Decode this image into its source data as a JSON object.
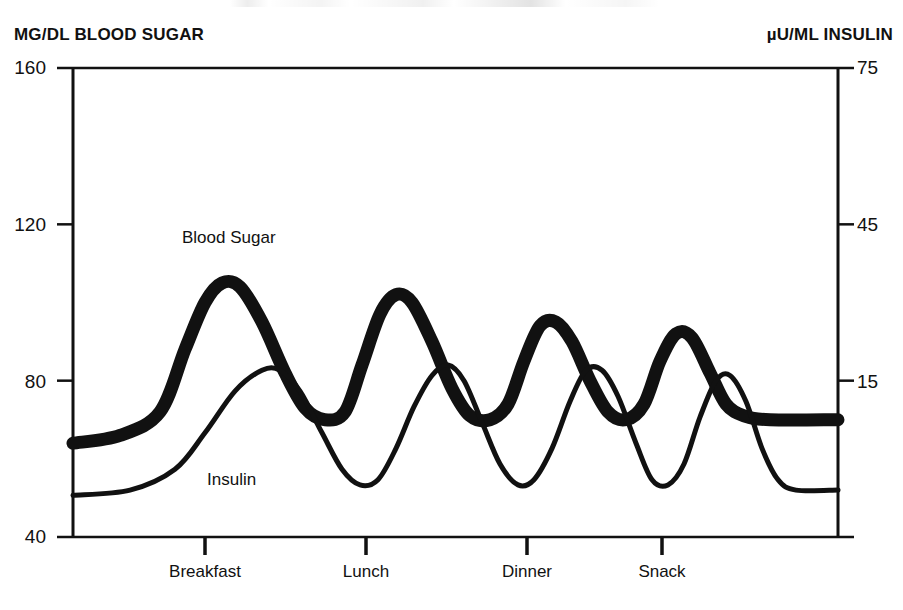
{
  "figure": {
    "width": 903,
    "height": 610,
    "background": "#ffffff",
    "ink_color": "#111111"
  },
  "left_axis": {
    "title": "MG/DL BLOOD SUGAR",
    "ticks": [
      "160",
      "120",
      "80",
      "40"
    ],
    "min": 40,
    "max": 160
  },
  "right_axis": {
    "title": "µU/ML INSULIN",
    "ticks": [
      "75",
      "45",
      "15"
    ],
    "min": -15,
    "max": 75
  },
  "x_axis": {
    "ticks": [
      "Breakfast",
      "Lunch",
      "Dinner",
      "Snack"
    ]
  },
  "series_labels": {
    "blood_sugar": "Blood Sugar",
    "insulin": "Insulin"
  },
  "chart_data": {
    "type": "line",
    "title": "",
    "xlabel": "",
    "ylabel": "MG/DL BLOOD SUGAR",
    "y2label": "µU/ML INSULIN",
    "ylim": [
      40,
      160
    ],
    "y2lim": [
      -15,
      75
    ],
    "grid": false,
    "legend": "inline-annotations",
    "xticks": [
      "Breakfast",
      "Lunch",
      "Dinner",
      "Snack"
    ],
    "xtick_positions": [
      205,
      366,
      527,
      662
    ],
    "yticks": [
      160,
      120,
      80,
      40
    ],
    "y2ticks": [
      75,
      45,
      15
    ],
    "series": [
      {
        "name": "Blood Sugar",
        "axis": "left",
        "units": "mg/dL",
        "style": "thick",
        "linewidth_px": 13,
        "color": "#111111",
        "points": [
          {
            "x": 73,
            "value": 64
          },
          {
            "x": 120,
            "value": 66
          },
          {
            "x": 160,
            "value": 72
          },
          {
            "x": 185,
            "value": 88
          },
          {
            "x": 205,
            "value": 100
          },
          {
            "x": 222,
            "value": 105
          },
          {
            "x": 240,
            "value": 104
          },
          {
            "x": 262,
            "value": 95
          },
          {
            "x": 285,
            "value": 82
          },
          {
            "x": 305,
            "value": 73
          },
          {
            "x": 325,
            "value": 70
          },
          {
            "x": 345,
            "value": 72
          },
          {
            "x": 362,
            "value": 84
          },
          {
            "x": 380,
            "value": 97
          },
          {
            "x": 396,
            "value": 102
          },
          {
            "x": 412,
            "value": 100
          },
          {
            "x": 432,
            "value": 90
          },
          {
            "x": 452,
            "value": 78
          },
          {
            "x": 470,
            "value": 71
          },
          {
            "x": 490,
            "value": 70
          },
          {
            "x": 508,
            "value": 74
          },
          {
            "x": 524,
            "value": 85
          },
          {
            "x": 540,
            "value": 94
          },
          {
            "x": 556,
            "value": 95
          },
          {
            "x": 572,
            "value": 90
          },
          {
            "x": 590,
            "value": 80
          },
          {
            "x": 608,
            "value": 72
          },
          {
            "x": 626,
            "value": 70
          },
          {
            "x": 644,
            "value": 74
          },
          {
            "x": 660,
            "value": 85
          },
          {
            "x": 676,
            "value": 92
          },
          {
            "x": 692,
            "value": 91
          },
          {
            "x": 710,
            "value": 82
          },
          {
            "x": 726,
            "value": 74
          },
          {
            "x": 744,
            "value": 71
          },
          {
            "x": 770,
            "value": 70
          },
          {
            "x": 838,
            "value": 70
          }
        ]
      },
      {
        "name": "Insulin",
        "axis": "right",
        "units": "µU/mL",
        "style": "thin",
        "linewidth_px": 5,
        "color": "#111111",
        "points": [
          {
            "x": 73,
            "value": -7
          },
          {
            "x": 130,
            "value": -6
          },
          {
            "x": 175,
            "value": -2
          },
          {
            "x": 205,
            "value": 5
          },
          {
            "x": 235,
            "value": 13
          },
          {
            "x": 262,
            "value": 17
          },
          {
            "x": 280,
            "value": 17
          },
          {
            "x": 300,
            "value": 13
          },
          {
            "x": 322,
            "value": 5
          },
          {
            "x": 342,
            "value": -2
          },
          {
            "x": 360,
            "value": -5
          },
          {
            "x": 378,
            "value": -4
          },
          {
            "x": 396,
            "value": 2
          },
          {
            "x": 414,
            "value": 10
          },
          {
            "x": 432,
            "value": 16
          },
          {
            "x": 448,
            "value": 18
          },
          {
            "x": 464,
            "value": 15
          },
          {
            "x": 482,
            "value": 7
          },
          {
            "x": 500,
            "value": -1
          },
          {
            "x": 518,
            "value": -5
          },
          {
            "x": 534,
            "value": -4
          },
          {
            "x": 552,
            "value": 2
          },
          {
            "x": 570,
            "value": 11
          },
          {
            "x": 586,
            "value": 17
          },
          {
            "x": 602,
            "value": 17
          },
          {
            "x": 618,
            "value": 12
          },
          {
            "x": 636,
            "value": 3
          },
          {
            "x": 652,
            "value": -4
          },
          {
            "x": 668,
            "value": -5
          },
          {
            "x": 684,
            "value": -1
          },
          {
            "x": 700,
            "value": 8
          },
          {
            "x": 716,
            "value": 15
          },
          {
            "x": 730,
            "value": 16
          },
          {
            "x": 746,
            "value": 11
          },
          {
            "x": 762,
            "value": 2
          },
          {
            "x": 778,
            "value": -4
          },
          {
            "x": 796,
            "value": -6
          },
          {
            "x": 838,
            "value": -6
          }
        ]
      }
    ]
  }
}
